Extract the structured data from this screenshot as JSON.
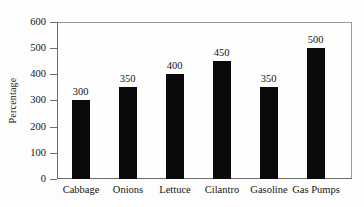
{
  "chart_data": {
    "type": "bar",
    "title": "",
    "xlabel": "",
    "ylabel": "Percentage",
    "categories": [
      "Cabbage",
      "Onions",
      "Lettuce",
      "Cilantro",
      "Gasoline",
      "Gas Pumps"
    ],
    "values": [
      300,
      350,
      400,
      450,
      350,
      500
    ],
    "value_labels": [
      "300",
      "350",
      "400",
      "450",
      "350",
      "500"
    ],
    "ylim": [
      0,
      600
    ],
    "ytick_values": [
      0,
      100,
      200,
      300,
      400,
      500,
      600
    ],
    "ytick_labels": [
      "0",
      "100",
      "200",
      "300",
      "400",
      "500",
      "600"
    ],
    "grid": false,
    "legend": null,
    "bar_color": "#0a0a0a",
    "frame_color": "#6d6d6d",
    "background_color": "#fdfdfd",
    "show_value_labels": true
  }
}
